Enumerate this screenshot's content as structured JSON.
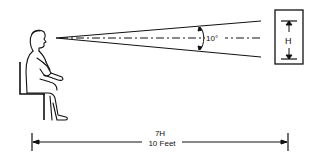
{
  "diagram": {
    "angle_label": "10°",
    "screen_label": "H",
    "distance_ratio": "7H",
    "distance_value": "10 Feet",
    "colors": {
      "line": "#111111",
      "background": "#ffffff"
    }
  }
}
